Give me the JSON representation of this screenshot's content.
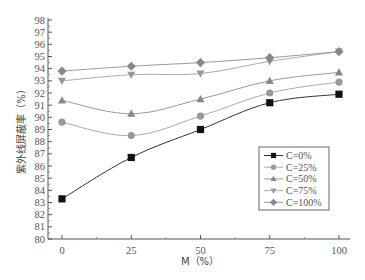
{
  "chart_data": {
    "type": "line",
    "title": "",
    "xlabel": "M（%）",
    "ylabel": "紫外线屏蔽率（%）",
    "x": [
      0,
      25,
      50,
      75,
      100
    ],
    "x_tick_labels": [
      "0",
      "25",
      "50",
      "75",
      "100"
    ],
    "xlim": [
      -3,
      103
    ],
    "ylim": [
      80,
      98
    ],
    "y_ticks": [
      80,
      81,
      82,
      83,
      84,
      85,
      86,
      87,
      88,
      89,
      90,
      91,
      92,
      93,
      94,
      95,
      96,
      97,
      98
    ],
    "grid": false,
    "legend_position": "lower right (inside)",
    "series": [
      {
        "name": "C=0%",
        "marker": "square",
        "color": "#111111",
        "line_color": "#333333",
        "values": [
          83.3,
          86.7,
          89.0,
          91.2,
          91.9
        ]
      },
      {
        "name": "C=25%",
        "marker": "circle",
        "color": "#999999",
        "line_color": "#aaaaaa",
        "values": [
          89.6,
          88.5,
          90.1,
          92.0,
          92.9
        ]
      },
      {
        "name": "C=50%",
        "marker": "triangle-up",
        "color": "#888888",
        "line_color": "#999999",
        "values": [
          91.4,
          90.3,
          91.5,
          93.0,
          93.7
        ]
      },
      {
        "name": "C=75%",
        "marker": "triangle-down",
        "color": "#999999",
        "line_color": "#aaaaaa",
        "values": [
          93.0,
          93.5,
          93.6,
          94.6,
          95.4
        ]
      },
      {
        "name": "C=100%",
        "marker": "diamond",
        "color": "#888888",
        "line_color": "#999999",
        "values": [
          93.8,
          94.2,
          94.5,
          94.9,
          95.4
        ]
      }
    ]
  }
}
